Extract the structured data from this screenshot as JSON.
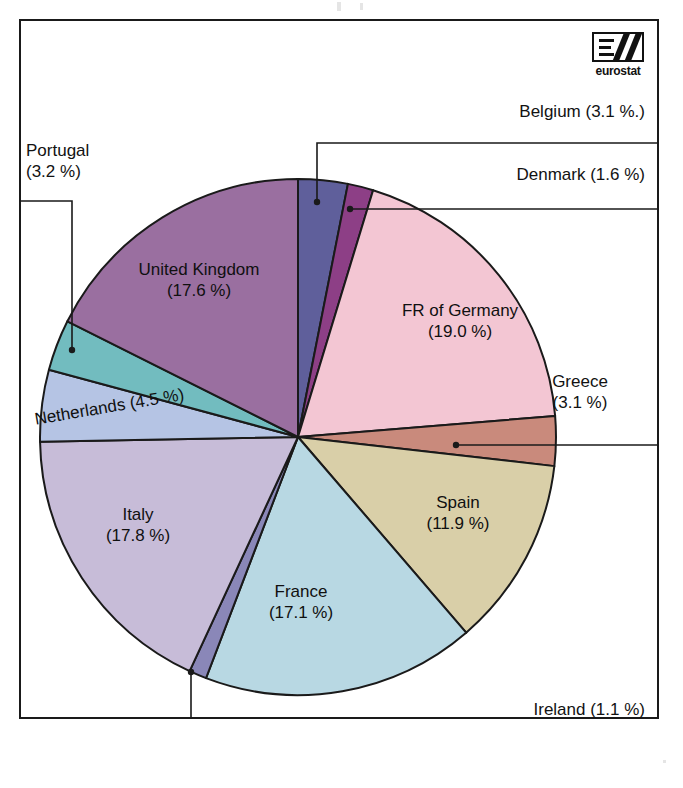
{
  "logo": {
    "name": "eurostat-logo",
    "wordmark": "eurostat"
  },
  "chart_data": {
    "type": "pie",
    "title": "",
    "subtitle": "",
    "xlabel": "",
    "ylabel": "",
    "legend_position": "none",
    "grid": false,
    "unit": "%",
    "categories": [
      "Belgium",
      "Denmark",
      "FR of Germany",
      "Greece",
      "Spain",
      "France",
      "Ireland",
      "Italy",
      "Netherlands",
      "Portugal",
      "United Kingdom"
    ],
    "values": [
      3.1,
      1.6,
      19.0,
      3.1,
      11.9,
      17.1,
      1.1,
      17.8,
      4.5,
      3.2,
      17.6
    ],
    "slices": [
      {
        "name": "Belgium",
        "value": 3.1,
        "label": "Belgium (3.1 %.)",
        "color": "#5f5f9b",
        "label_placement": "outside",
        "start_angle": 0.0,
        "end_angle": 11.16
      },
      {
        "name": "Denmark",
        "value": 1.6,
        "label": "Denmark (1.6 %)",
        "color": "#8d3f86",
        "label_placement": "outside",
        "start_angle": 11.16,
        "end_angle": 16.92
      },
      {
        "name": "FR of Germany",
        "value": 19.0,
        "label_line1": "FR of Germany",
        "label_line2": "(19.0 %)",
        "color": "#f3c6d3",
        "label_placement": "inside",
        "start_angle": 16.92,
        "end_angle": 85.32
      },
      {
        "name": "Greece",
        "value": 3.1,
        "label_line1": "Greece",
        "label_line2": "(3.1 %)",
        "color": "#c98a7c",
        "label_placement": "outside",
        "start_angle": 85.32,
        "end_angle": 96.48
      },
      {
        "name": "Spain",
        "value": 11.9,
        "label_line1": "Spain",
        "label_line2": "(11.9 %)",
        "color": "#d9cfa8",
        "label_placement": "inside",
        "start_angle": 96.48,
        "end_angle": 139.32
      },
      {
        "name": "France",
        "value": 17.1,
        "label_line1": "France",
        "label_line2": "(17.1 %)",
        "color": "#b8d8e3",
        "label_placement": "inside",
        "start_angle": 139.32,
        "end_angle": 200.88
      },
      {
        "name": "Ireland",
        "value": 1.1,
        "label": "Ireland (1.1 %)",
        "color": "#8a87b8",
        "label_placement": "outside",
        "start_angle": 200.88,
        "end_angle": 204.84
      },
      {
        "name": "Italy",
        "value": 17.8,
        "label_line1": "Italy",
        "label_line2": "(17.8 %)",
        "color": "#c7bcd8",
        "label_placement": "inside",
        "start_angle": 204.84,
        "end_angle": 268.92
      },
      {
        "name": "Netherlands",
        "value": 4.5,
        "label": "Netherlands (4.5 %)",
        "color": "#b5c4e4",
        "label_placement": "inside",
        "start_angle": 268.92,
        "end_angle": 285.12
      },
      {
        "name": "Portugal",
        "value": 3.2,
        "label_line1": "Portugal",
        "label_line2": "(3.2 %)",
        "color": "#72bcbf",
        "label_placement": "outside",
        "start_angle": 285.12,
        "end_angle": 296.64
      },
      {
        "name": "United Kingdom",
        "value": 17.6,
        "label_line1": "United Kingdom",
        "label_line2": "(17.6 %)",
        "color": "#9a6fa0",
        "label_placement": "inside",
        "start_angle": 296.64,
        "end_angle": 360.0
      }
    ]
  },
  "labels": {
    "belgium": "Belgium (3.1 %.)",
    "denmark": "Denmark (1.6 %)",
    "germany_l1": "FR of Germany",
    "germany_l2": "(19.0 %)",
    "greece_l1": "Greece",
    "greece_l2": "(3.1 %)",
    "spain_l1": "Spain",
    "spain_l2": "(11.9 %)",
    "france_l1": "France",
    "france_l2": "(17.1 %)",
    "ireland": "Ireland (1.1 %)",
    "italy_l1": "Italy",
    "italy_l2": "(17.8 %)",
    "netherlands": "Netherlands (4.5 %)",
    "portugal_l1": "Portugal",
    "portugal_l2": "(3.2 %)",
    "uk_l1": "United Kingdom",
    "uk_l2": "(17.6 %)"
  },
  "colors": {
    "outline": "#1a1a1a",
    "background": "#ffffff",
    "text": "#121212"
  }
}
